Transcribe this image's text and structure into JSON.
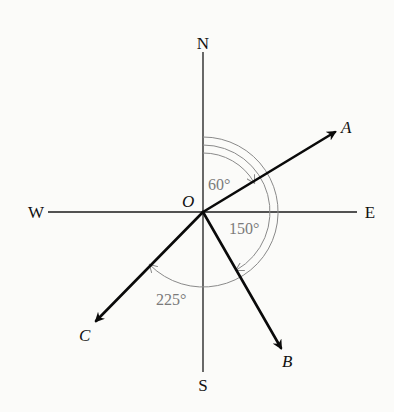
{
  "diagram": {
    "type": "compass-bearing-vectors",
    "origin_label": "O",
    "directions": {
      "north": "N",
      "south": "S",
      "east": "E",
      "west": "W"
    },
    "vectors": [
      {
        "label": "A",
        "bearing_deg": 60
      },
      {
        "label": "B",
        "bearing_deg": 150
      },
      {
        "label": "C",
        "bearing_deg": 225
      }
    ],
    "angle_labels": [
      {
        "text": "60°",
        "for": "A"
      },
      {
        "text": "150°",
        "for": "B"
      },
      {
        "text": "225°",
        "for": "C"
      }
    ],
    "colors": {
      "background": "#fbfbf9",
      "axes": "#1a1a1a",
      "vectors": "#0a0a0a",
      "arcs": "#8a8a8a",
      "angle_text": "#7a7a7a"
    }
  }
}
